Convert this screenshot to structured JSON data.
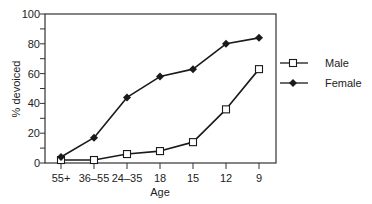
{
  "chart_data": {
    "type": "line",
    "title": "",
    "xlabel": "Age",
    "ylabel": "% devoiced",
    "categories": [
      "55+",
      "36–55",
      "24–35",
      "18",
      "15",
      "12",
      "9"
    ],
    "ylim": [
      0,
      100
    ],
    "yticks": [
      0,
      20,
      40,
      60,
      80,
      100
    ],
    "grid": false,
    "legend_position": "right",
    "series": [
      {
        "name": "Male",
        "marker": "open-square",
        "values": [
          2,
          2,
          6,
          8,
          14,
          36,
          63
        ]
      },
      {
        "name": "Female",
        "marker": "filled-diamond",
        "values": [
          4,
          17,
          44,
          58,
          63,
          80,
          84
        ]
      }
    ]
  },
  "legend": {
    "male_label": "Male",
    "female_label": "Female"
  },
  "axes": {
    "xlabel": "Age",
    "ylabel": "% devoiced"
  },
  "colors": {
    "line": "#1a1a1a",
    "axis": "#333333",
    "background": "#ffffff"
  }
}
